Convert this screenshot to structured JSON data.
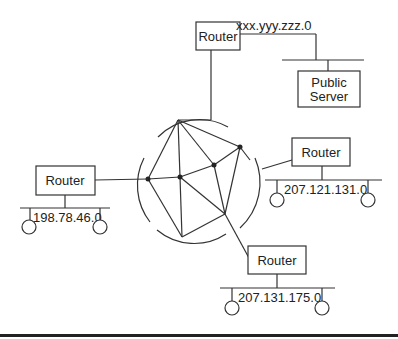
{
  "diagram": {
    "type": "network-topology",
    "cloud": {
      "description": "mesh network of interconnected nodes"
    },
    "routers": [
      {
        "id": "top",
        "label": "Router",
        "link_label": "xxx.yyy.zzz.0"
      },
      {
        "id": "right",
        "label": "Router",
        "network": "207.121.131.0"
      },
      {
        "id": "left",
        "label": "Router",
        "network": "198.78.46.0"
      },
      {
        "id": "bottom",
        "label": "Router",
        "network": "207.131.175.0"
      }
    ],
    "server": {
      "line1": "Public",
      "line2": "Server"
    },
    "colors": {
      "line": "#333333",
      "background": "#ffffff",
      "text": "#222222"
    }
  }
}
